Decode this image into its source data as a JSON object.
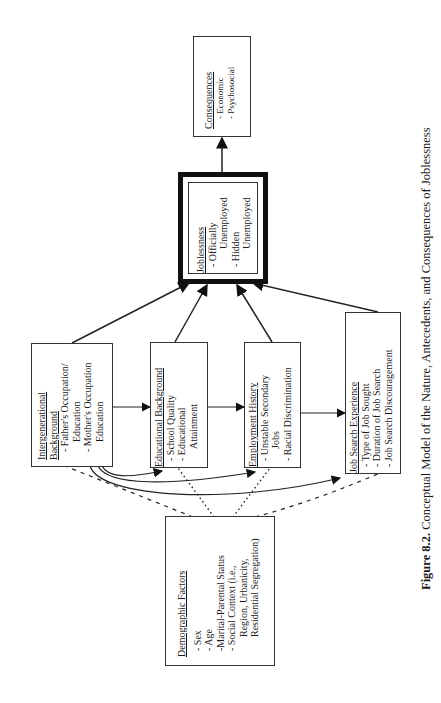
{
  "boxes": {
    "consequences": {
      "title": "Consequences",
      "items": [
        "- Economic",
        "- Psychosocial"
      ]
    },
    "joblessness": {
      "title": "Joblessness",
      "items": [
        "- Officially",
        "Unemployed",
        "- Hidden",
        "Unemployed"
      ]
    },
    "intergenerational": {
      "title_line1": "Intergenerational",
      "title_line2": "Background",
      "items": [
        "- Father's Occupation/",
        "Education",
        "- Mother's Occupation",
        "Education"
      ]
    },
    "educational": {
      "title": "Educational   Background",
      "items": [
        "- School Quality",
        "- Educational",
        "Attainment"
      ]
    },
    "employment": {
      "title": "Employment   History",
      "items": [
        "- Unstable  Secondary",
        "Jobs",
        "- Racial  Discrimination"
      ]
    },
    "jobsearch": {
      "title": "Job  Search  Experience",
      "items": [
        "- Type of Job Sought",
        "- Duration  of  Job  Search",
        "- Job  Search  Discouragement"
      ]
    },
    "demographic": {
      "title": "Demographic   Factors",
      "items": [
        "- Sex",
        "- Age",
        "-Marital-Parental  Status",
        "- Social  Context  (i.e.,",
        "Region,  Urbanicity,",
        "Residential  Segregation)"
      ]
    }
  },
  "caption": {
    "label": "Figure 8.2.",
    "text": "Conceptual Model of the Nature, Antecedents, and Consequences of Joblessness"
  },
  "colors": {
    "line": "#222222",
    "background": "#ffffff"
  }
}
